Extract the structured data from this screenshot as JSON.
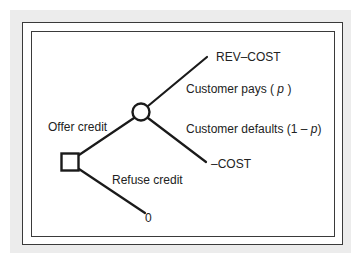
{
  "diagram": {
    "type": "decision-tree",
    "colors": {
      "line": "#1a1a1a",
      "text": "#222222",
      "backdrop": "#ececec",
      "frame": "#3a3a3a"
    },
    "nodes": {
      "decision": {
        "shape": "square",
        "role": "decision-node"
      },
      "chance": {
        "shape": "circle",
        "role": "chance-node"
      }
    },
    "branches": {
      "offer": {
        "label": "Offer credit"
      },
      "refuse": {
        "label": "Refuse credit"
      },
      "pays": {
        "label_prefix": "Customer pays ( ",
        "label_var": "p",
        "label_suffix": " )"
      },
      "defaults": {
        "label_prefix": "Customer defaults (1 – ",
        "label_var": "p",
        "label_suffix": ")"
      }
    },
    "outcomes": {
      "pays_payoff": "REV–COST",
      "defaults_payoff": "–COST",
      "refuse_payoff": "0"
    }
  }
}
